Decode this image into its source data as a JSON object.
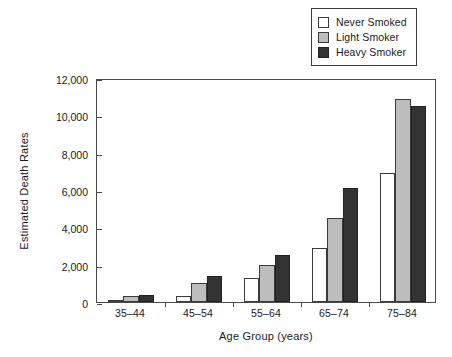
{
  "chart_data": {
    "type": "bar",
    "title": "",
    "xlabel": "Age Group (years)",
    "ylabel": "Estimated Death Rates",
    "categories": [
      "35–44",
      "45–54",
      "55–64",
      "65–74",
      "75–84"
    ],
    "series": [
      {
        "name": "Never Smoked",
        "color": "#ffffff",
        "values": [
          100,
          300,
          1300,
          2900,
          6900
        ]
      },
      {
        "name": "Light Smoker",
        "color": "#bdbdbd",
        "values": [
          300,
          1000,
          2000,
          4500,
          10900
        ]
      },
      {
        "name": "Heavy Smoker",
        "color": "#333333",
        "values": [
          400,
          1400,
          2500,
          6100,
          10500
        ]
      }
    ],
    "ylim": [
      0,
      12000
    ],
    "yticks": [
      0,
      2000,
      4000,
      6000,
      8000,
      10000,
      12000
    ],
    "ytick_labels": [
      "0",
      "2,000",
      "4,000",
      "6,000",
      "8,000",
      "10,000",
      "12,000"
    ],
    "grid": false,
    "legend_position": "top-right",
    "legend_entries": [
      "Never Smoked",
      "Light Smoker",
      "Heavy Smoker"
    ]
  }
}
